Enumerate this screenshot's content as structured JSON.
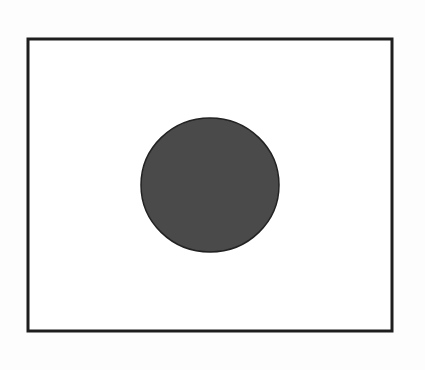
{
  "diagram": {
    "canvas": {
      "width": 425,
      "height": 370,
      "background": "#fdfdfd"
    },
    "frame": {
      "x": 28,
      "y": 39,
      "width": 364,
      "height": 292,
      "stroke": "#1e1e1e",
      "stroke_width": 3,
      "fill": "#ffffff"
    },
    "circle": {
      "cx": 210,
      "cy": 185,
      "rx": 69,
      "ry": 67,
      "fill": "#4a4a4a",
      "stroke": "#222222",
      "stroke_width": 1.5
    }
  }
}
